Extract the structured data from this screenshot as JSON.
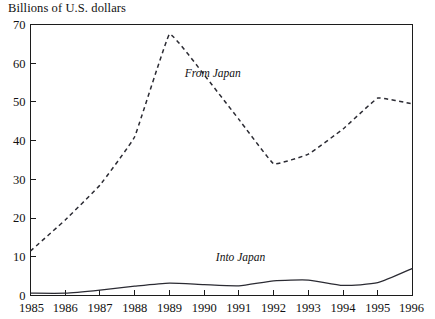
{
  "chart_data": {
    "type": "line",
    "title": "Billions of U.S. dollars",
    "xlabel": "",
    "ylabel": "",
    "ylim": [
      0,
      70
    ],
    "yticks": [
      0,
      10,
      20,
      30,
      40,
      50,
      60,
      70
    ],
    "categories": [
      "1985",
      "1986",
      "1987",
      "1988",
      "1989",
      "1990",
      "1991",
      "1992",
      "1993",
      "1994",
      "1995",
      "1996"
    ],
    "grid": false,
    "legend_position": "inline-annotations",
    "series": [
      {
        "name": "From Japan",
        "style": "dashed",
        "color": "#2b2b33",
        "values": [
          11.5,
          19.5,
          28.5,
          41.0,
          67.5,
          57.0,
          45.5,
          34.0,
          36.5,
          43.0,
          51.0,
          49.5
        ]
      },
      {
        "name": "Into Japan",
        "style": "solid",
        "color": "#2b2b33",
        "values": [
          0.6,
          0.6,
          1.4,
          2.4,
          3.2,
          2.8,
          2.5,
          3.8,
          4.0,
          2.6,
          3.3,
          7.0
        ]
      }
    ],
    "annotations": [
      {
        "text": "From Japan",
        "x": 1990.25,
        "y": 56.5
      },
      {
        "text": "Into Japan",
        "x": 1991.05,
        "y": 8.8
      }
    ]
  }
}
